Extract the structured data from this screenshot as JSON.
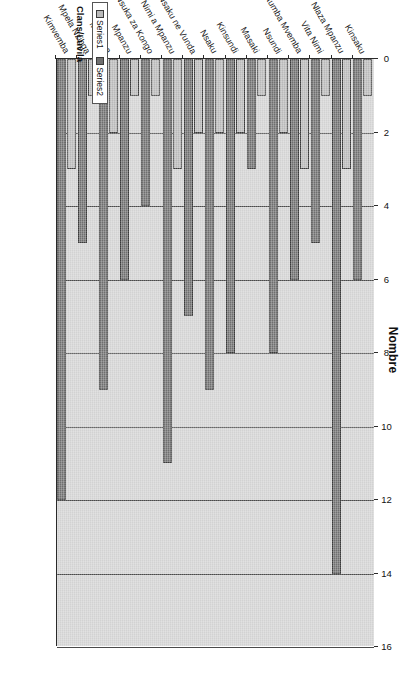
{
  "chart_data": {
    "type": "bar",
    "orientation": "vertical-rendered-rotated",
    "title": "Nombre",
    "xlabel": "Clans/Luvila",
    "ylabel": "Nombre",
    "ylim": [
      0,
      16
    ],
    "ticks": [
      "0",
      "2",
      "4",
      "6",
      "8",
      "10",
      "12",
      "14",
      "16"
    ],
    "grid": true,
    "legend_position": "bottom-left",
    "categories": [
      "Kinsaku",
      "Nlaza Mpanzu",
      "Vita Nimi",
      "Ntumba Mvemba",
      "Nsundi",
      "Masaki",
      "Kinsundi",
      "Nsaku",
      "Nsaku ne Vunda",
      "Nimi a Mpanzu",
      "Nsuka za Kongo",
      "Mpanzu",
      "Mvemba",
      "Mpela Nzibga",
      "Kimvemba"
    ],
    "series": [
      {
        "name": "Series1",
        "color": "#b9b9b9",
        "values": [
          1,
          3,
          1,
          3,
          2,
          1,
          2,
          2,
          2,
          3,
          1,
          1,
          2,
          1,
          3
        ]
      },
      {
        "name": "Series2",
        "color": "#6f6f6f",
        "values": [
          6,
          14,
          5,
          6,
          8,
          3,
          8,
          9,
          7,
          11,
          4,
          6,
          9,
          5,
          12
        ]
      }
    ]
  },
  "legend": {
    "entries": [
      "Series1",
      "Series2"
    ]
  },
  "axis": {
    "value_title": "Nombre",
    "category_title": "Clans/Luvila"
  }
}
